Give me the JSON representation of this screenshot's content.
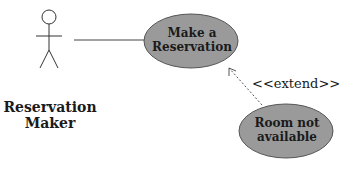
{
  "diagram": {
    "type": "UML use case diagram",
    "actor": {
      "label": "Reservation Maker"
    },
    "use_cases": [
      {
        "id": "uc1",
        "label_line1": "Make a",
        "label_line2": "Reservation",
        "fill": "#9a9a9a"
      },
      {
        "id": "uc2",
        "label_line1": "Room not",
        "label_line2": "available",
        "fill": "#9a9a9a"
      }
    ],
    "relationships": [
      {
        "from": "actor",
        "to": "uc1",
        "kind": "association"
      },
      {
        "from": "uc2",
        "to": "uc1",
        "kind": "extend",
        "label": "<<extend>>"
      }
    ]
  }
}
